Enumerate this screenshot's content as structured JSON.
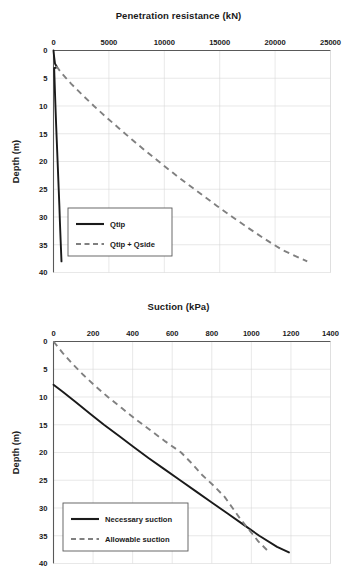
{
  "figure": {
    "panels": [
      {
        "id": "penetration-resistance-chart",
        "title": "Penetration resistance (kN)",
        "ylabel": "Depth (m)",
        "xticks": [
          "0",
          "5000",
          "10000",
          "15000",
          "20000",
          "25000"
        ],
        "yticks": [
          "0",
          "5",
          "10",
          "15",
          "20",
          "25",
          "30",
          "35",
          "40"
        ],
        "legend": [
          {
            "label": "Qtip",
            "style": "solid",
            "color": "#1a1a1a"
          },
          {
            "label": "Qtip + Qside",
            "style": "dashed",
            "color": "#808080"
          }
        ]
      },
      {
        "id": "suction-chart",
        "title": "Suction (kPa)",
        "ylabel": "Depth (m)",
        "xticks": [
          "0",
          "200",
          "400",
          "600",
          "800",
          "1000",
          "1200",
          "1400"
        ],
        "yticks": [
          "0",
          "5",
          "10",
          "15",
          "20",
          "25",
          "30",
          "35",
          "40"
        ],
        "legend": [
          {
            "label": "Necessary suction",
            "style": "solid",
            "color": "#1a1a1a"
          },
          {
            "label": "Allowable suction",
            "style": "dashed",
            "color": "#808080"
          }
        ]
      }
    ]
  },
  "chart_data": [
    {
      "type": "line",
      "id": "penetration-resistance-chart",
      "title": "Penetration resistance (kN)",
      "xlabel": "Penetration resistance (kN)",
      "ylabel": "Depth (m)",
      "xlim": [
        0,
        25000
      ],
      "ylim": [
        40,
        0
      ],
      "x_ticks": [
        0,
        5000,
        10000,
        15000,
        20000,
        25000
      ],
      "y_ticks": [
        0,
        5,
        10,
        15,
        20,
        25,
        30,
        35,
        40
      ],
      "y_axis_inverted": true,
      "grid": true,
      "legend_position": "lower-left-inside",
      "series": [
        {
          "name": "Qtip",
          "style": "solid",
          "color": "#1a1a1a",
          "points": [
            {
              "depth": 0,
              "value": 0
            },
            {
              "depth": 1.2,
              "value": 60
            },
            {
              "depth": 2.4,
              "value": 140
            },
            {
              "depth": 3.0,
              "value": 330
            },
            {
              "depth": 3.2,
              "value": 60
            },
            {
              "depth": 5,
              "value": 90
            },
            {
              "depth": 8,
              "value": 140
            },
            {
              "depth": 10,
              "value": 175
            },
            {
              "depth": 13,
              "value": 230
            },
            {
              "depth": 16,
              "value": 290
            },
            {
              "depth": 19,
              "value": 350
            },
            {
              "depth": 22,
              "value": 410
            },
            {
              "depth": 25,
              "value": 470
            },
            {
              "depth": 28,
              "value": 530
            },
            {
              "depth": 31,
              "value": 580
            },
            {
              "depth": 34,
              "value": 640
            },
            {
              "depth": 36,
              "value": 680
            },
            {
              "depth": 38,
              "value": 720
            }
          ]
        },
        {
          "name": "Qtip + Qside",
          "style": "dashed",
          "color": "#808080",
          "points": [
            {
              "depth": 2.8,
              "value": 250
            },
            {
              "depth": 4,
              "value": 700
            },
            {
              "depth": 6,
              "value": 1600
            },
            {
              "depth": 8,
              "value": 2600
            },
            {
              "depth": 10,
              "value": 3650
            },
            {
              "depth": 12,
              "value": 4750
            },
            {
              "depth": 14,
              "value": 5900
            },
            {
              "depth": 16,
              "value": 7050
            },
            {
              "depth": 18,
              "value": 8250
            },
            {
              "depth": 20,
              "value": 9500
            },
            {
              "depth": 22,
              "value": 10750
            },
            {
              "depth": 24,
              "value": 12050
            },
            {
              "depth": 26,
              "value": 13400
            },
            {
              "depth": 28,
              "value": 14750
            },
            {
              "depth": 30,
              "value": 16150
            },
            {
              "depth": 32,
              "value": 17600
            },
            {
              "depth": 34,
              "value": 19100
            },
            {
              "depth": 36,
              "value": 20700
            },
            {
              "depth": 38,
              "value": 22900
            }
          ]
        }
      ]
    },
    {
      "type": "line",
      "id": "suction-chart",
      "title": "Suction (kPa)",
      "xlabel": "Suction (kPa)",
      "ylabel": "Depth (m)",
      "xlim": [
        0,
        1400
      ],
      "ylim": [
        40,
        0
      ],
      "x_ticks": [
        0,
        200,
        400,
        600,
        800,
        1000,
        1200,
        1400
      ],
      "y_ticks": [
        0,
        5,
        10,
        15,
        20,
        25,
        30,
        35,
        40
      ],
      "y_axis_inverted": true,
      "grid": true,
      "legend_position": "lower-left-inside",
      "series": [
        {
          "name": "Necessary suction",
          "style": "solid",
          "color": "#1a1a1a",
          "points": [
            {
              "depth": 7.8,
              "value": 0
            },
            {
              "depth": 9,
              "value": 45
            },
            {
              "depth": 11,
              "value": 115
            },
            {
              "depth": 13,
              "value": 185
            },
            {
              "depth": 15,
              "value": 255
            },
            {
              "depth": 17,
              "value": 330
            },
            {
              "depth": 19,
              "value": 405
            },
            {
              "depth": 21,
              "value": 480
            },
            {
              "depth": 23,
              "value": 560
            },
            {
              "depth": 25,
              "value": 640
            },
            {
              "depth": 27,
              "value": 720
            },
            {
              "depth": 29,
              "value": 800
            },
            {
              "depth": 31,
              "value": 880
            },
            {
              "depth": 33,
              "value": 960
            },
            {
              "depth": 35,
              "value": 1040
            },
            {
              "depth": 37,
              "value": 1130
            },
            {
              "depth": 38,
              "value": 1190
            }
          ]
        },
        {
          "name": "Allowable suction",
          "style": "dashed",
          "color": "#808080",
          "points": [
            {
              "depth": 0,
              "value": 0
            },
            {
              "depth": 2,
              "value": 45
            },
            {
              "depth": 4,
              "value": 95
            },
            {
              "depth": 6,
              "value": 150
            },
            {
              "depth": 8,
              "value": 210
            },
            {
              "depth": 10,
              "value": 275
            },
            {
              "depth": 12,
              "value": 345
            },
            {
              "depth": 14,
              "value": 415
            },
            {
              "depth": 16,
              "value": 490
            },
            {
              "depth": 18,
              "value": 565
            },
            {
              "depth": 20,
              "value": 645
            },
            {
              "depth": 22,
              "value": 700
            },
            {
              "depth": 24,
              "value": 750
            },
            {
              "depth": 26,
              "value": 810
            },
            {
              "depth": 28,
              "value": 865
            },
            {
              "depth": 30,
              "value": 905
            },
            {
              "depth": 32,
              "value": 945
            },
            {
              "depth": 34,
              "value": 990
            },
            {
              "depth": 36,
              "value": 1035
            },
            {
              "depth": 37.8,
              "value": 1085
            }
          ]
        }
      ]
    }
  ]
}
